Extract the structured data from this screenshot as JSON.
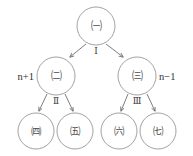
{
  "diagram": {
    "type": "tree",
    "title": "",
    "canvas": {
      "width": 193,
      "height": 156,
      "background": "#ffffff"
    },
    "stroke_color": "#8a8a8a",
    "edge_color": "#6e6e6e",
    "text_color": "#3a3a3a",
    "levels": [
      {
        "level": 1,
        "nodes": [
          {
            "id": "n-top",
            "label": "㈠",
            "cx": 96,
            "cy": 26,
            "r": 19,
            "inner_r": 5.2
          }
        ]
      },
      {
        "level": 2,
        "nodes": [
          {
            "id": "n-left",
            "label": "㈡",
            "cx": 56,
            "cy": 76,
            "r": 19,
            "inner_r": 5.2
          },
          {
            "id": "n-right",
            "label": "㈢",
            "cx": 137,
            "cy": 76,
            "r": 19,
            "inner_r": 5.2
          }
        ]
      },
      {
        "level": 3,
        "nodes": [
          {
            "id": "n-leaf-1",
            "label": "㈣",
            "cx": 36,
            "cy": 131,
            "r": 18,
            "inner_r": 5.0
          },
          {
            "id": "n-leaf-2",
            "label": "㈤",
            "cx": 75,
            "cy": 131,
            "r": 18,
            "inner_r": 5.0
          },
          {
            "id": "n-leaf-3",
            "label": "㈥",
            "cx": 119,
            "cy": 131,
            "r": 18,
            "inner_r": 5.0
          },
          {
            "id": "n-leaf-4",
            "label": "㈦",
            "cx": 158,
            "cy": 131,
            "r": 18,
            "inner_r": 5.0
          }
        ]
      }
    ],
    "edges": [
      {
        "id": "e-top-left",
        "from": "n-top",
        "to": "n-left",
        "x1": 86,
        "y1": 44,
        "x2": 70,
        "y2": 57
      },
      {
        "id": "e-top-right",
        "from": "n-top",
        "to": "n-right",
        "x1": 106,
        "y1": 44,
        "x2": 123,
        "y2": 57
      },
      {
        "id": "e-left-leaf1",
        "from": "n-left",
        "to": "n-leaf-1",
        "x1": 47,
        "y1": 94,
        "x2": 39,
        "y2": 111
      },
      {
        "id": "e-left-leaf2",
        "from": "n-left",
        "to": "n-leaf-2",
        "x1": 65,
        "y1": 94,
        "x2": 73,
        "y2": 111
      },
      {
        "id": "e-right-leaf3",
        "from": "n-right",
        "to": "n-leaf-3",
        "x1": 128,
        "y1": 94,
        "x2": 121,
        "y2": 111
      },
      {
        "id": "e-right-leaf4",
        "from": "n-right",
        "to": "n-leaf-4",
        "x1": 147,
        "y1": 94,
        "x2": 155,
        "y2": 111
      }
    ],
    "edge_labels": [
      {
        "id": "label-I",
        "text": "Ⅰ",
        "x": 96,
        "y": 51
      },
      {
        "id": "label-II",
        "text": "Ⅱ",
        "x": 56,
        "y": 101
      },
      {
        "id": "label-III",
        "text": "Ⅲ",
        "x": 137,
        "y": 101
      }
    ],
    "side_labels": [
      {
        "id": "label-n-plus-1",
        "text": "n+1",
        "x": 34,
        "y": 76,
        "align": "end"
      },
      {
        "id": "label-n-minus-1",
        "text": "n−1",
        "x": 159,
        "y": 76,
        "align": "start"
      }
    ]
  }
}
